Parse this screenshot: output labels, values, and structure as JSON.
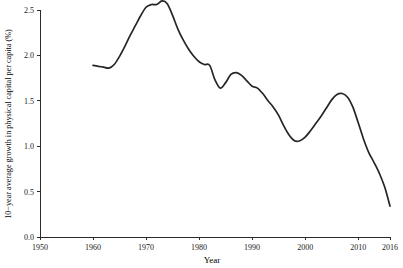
{
  "chart_data": {
    "type": "line",
    "title": "",
    "xlabel": "Year",
    "ylabel": "10−year average growth in physical capital per capita (%)",
    "xlim": [
      1950,
      2016
    ],
    "ylim": [
      0.0,
      2.5
    ],
    "grid": false,
    "legend": null,
    "xticks": [
      1950,
      1960,
      1970,
      1980,
      1990,
      2000,
      2010,
      2016
    ],
    "xtick_labels": [
      "1950",
      "1960",
      "1970",
      "1980",
      "1990",
      "2000",
      "2010",
      "2016"
    ],
    "yticks": [
      0.0,
      0.5,
      1.0,
      1.5,
      2.0,
      2.5
    ],
    "ytick_labels": [
      "0.0",
      "0.5",
      "1.0",
      "1.5",
      "2.0",
      "2.5"
    ],
    "line_color": "#262626",
    "series": [
      {
        "name": "10-year average growth in physical capital per capita",
        "x": [
          1960,
          1961,
          1962,
          1963,
          1964,
          1965,
          1966,
          1967,
          1968,
          1969,
          1970,
          1971,
          1972,
          1973,
          1974,
          1975,
          1976,
          1977,
          1978,
          1979,
          1980,
          1981,
          1982,
          1983,
          1984,
          1985,
          1986,
          1987,
          1988,
          1989,
          1990,
          1991,
          1992,
          1993,
          1994,
          1995,
          1996,
          1997,
          1998,
          1999,
          2000,
          2001,
          2002,
          2003,
          2004,
          2005,
          2006,
          2007,
          2008,
          2009,
          2010,
          2011,
          2012,
          2013,
          2014,
          2015,
          2016
        ],
        "values": [
          1.89,
          1.88,
          1.87,
          1.86,
          1.9,
          1.99,
          2.1,
          2.22,
          2.33,
          2.44,
          2.53,
          2.56,
          2.56,
          2.6,
          2.57,
          2.44,
          2.29,
          2.17,
          2.07,
          1.99,
          1.93,
          1.9,
          1.89,
          1.73,
          1.64,
          1.7,
          1.79,
          1.81,
          1.78,
          1.72,
          1.66,
          1.64,
          1.58,
          1.5,
          1.43,
          1.34,
          1.22,
          1.12,
          1.06,
          1.06,
          1.1,
          1.17,
          1.25,
          1.33,
          1.42,
          1.51,
          1.57,
          1.58,
          1.54,
          1.43,
          1.26,
          1.08,
          0.93,
          0.82,
          0.7,
          0.55,
          0.34
        ]
      }
    ],
    "annotations": [
      {
        "label": "series start",
        "x": 1960,
        "y": 1.89
      },
      {
        "label": "initial plateau",
        "x": 1963,
        "y": 1.86
      },
      {
        "label": "global maximum",
        "x": 1973,
        "y": 2.6
      },
      {
        "label": "shoulder",
        "x": 1982,
        "y": 1.89
      },
      {
        "label": "local minimum",
        "x": 1984,
        "y": 1.64
      },
      {
        "label": "local maximum",
        "x": 1987,
        "y": 1.81
      },
      {
        "label": "global trough",
        "x": 1998,
        "y": 1.06
      },
      {
        "label": "secondary peak",
        "x": 2007,
        "y": 1.58
      },
      {
        "label": "series end",
        "x": 2016,
        "y": 0.34
      }
    ]
  },
  "axes": {
    "x_title": "Year",
    "y_title": "10−year average growth in physical capital per capita (%)"
  }
}
